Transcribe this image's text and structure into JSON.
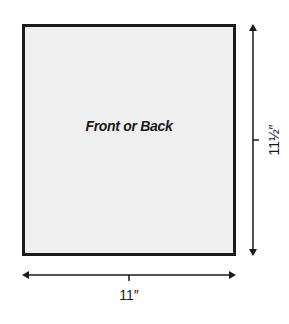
{
  "diagram": {
    "panel": {
      "label": "Front or Back",
      "fill": "#efefef",
      "border": "#1a1a1a"
    },
    "dimensions": {
      "width": {
        "label": "11″"
      },
      "height": {
        "label": "11½″"
      }
    }
  }
}
